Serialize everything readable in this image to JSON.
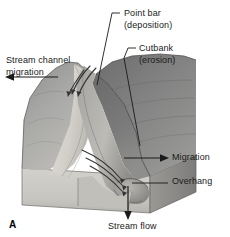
{
  "figure": {
    "panel_label": "A",
    "background_color": "#ffffff",
    "text_color": "#1a1a1a"
  },
  "labels": {
    "point_bar": {
      "line1": "Point bar",
      "line2": "(deposition)",
      "leader": "elbow-line-down-left"
    },
    "cutbank": {
      "line1": "Cutbank",
      "line2": "(erosion)",
      "leader": "elbow-line-down-right"
    },
    "stream_channel_migration": {
      "line1": "Stream channel",
      "line2": "migration",
      "leader": "arrow-left"
    },
    "migration": {
      "text": "Migration",
      "leader": "arrow-right"
    },
    "overhang": {
      "text": "Overhang",
      "leader": "plain-line-left"
    },
    "stream_flow": {
      "text": "Stream flow",
      "leader": "arrow-down"
    }
  },
  "artwork": {
    "style": "grayscale airbrush block diagram",
    "block_top_fill": "#9a9a9a",
    "block_front_fill": "#c9c8c4",
    "block_side_fill": "#8c8c8c",
    "far_bank_fill": "#7e7e7e",
    "near_bank_fill": "#a5a5a5",
    "point_bar_fill": "#d8d6d0",
    "water_fill": "#b4b3ae",
    "outline_color": "#4a4a4a",
    "flow_arrow_color": "#3a3a3a",
    "flow_arrow_groups": [
      {
        "name": "upper-channel-arrows",
        "count": 3,
        "direction": "down-left"
      },
      {
        "name": "lower-channel-arrows",
        "count": 3,
        "direction": "down-right"
      }
    ]
  }
}
